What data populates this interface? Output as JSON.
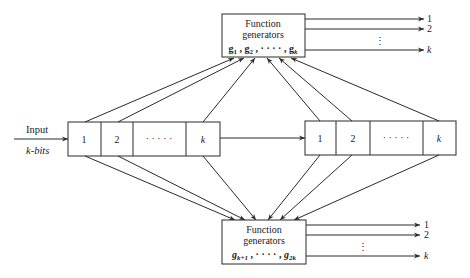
{
  "diagram": {
    "input": {
      "label": "Input",
      "sublabel": "k-bits"
    },
    "left_register": {
      "cells": [
        "1",
        "2",
        "· · · · ·",
        "k"
      ]
    },
    "right_register": {
      "cells": [
        "1",
        "2",
        "· · · · ·",
        "k"
      ]
    },
    "top_generator": {
      "title_line1": "Function",
      "title_line2": "generators",
      "functions": "g1 , g2 , · · · · , gk",
      "outputs": [
        "1",
        "2",
        "⋮",
        "k"
      ]
    },
    "bottom_generator": {
      "title_line1": "Function",
      "title_line2": "generators",
      "functions": "gk+1 , · · · · , g2k",
      "outputs": [
        "1",
        "2",
        "⋮",
        "k"
      ]
    },
    "colors": {
      "stroke": "#2a2a2a",
      "background": "#ffffff"
    }
  }
}
